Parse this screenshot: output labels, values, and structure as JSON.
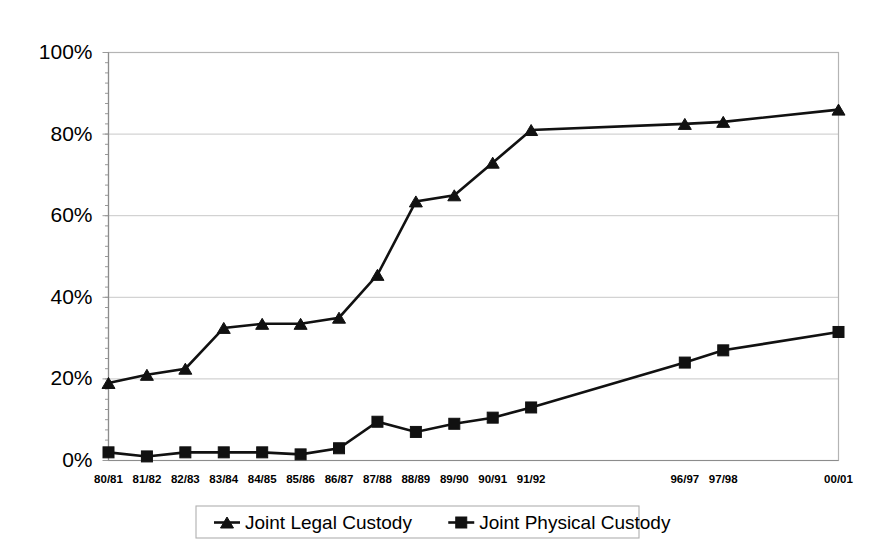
{
  "chart_data": {
    "type": "line",
    "title": "",
    "subtitle": "",
    "xlabel": "",
    "ylabel": "",
    "ylim": [
      0,
      100
    ],
    "ytick_values": [
      0,
      20,
      40,
      60,
      80,
      100
    ],
    "ytick_labels": [
      "0%",
      "20%",
      "40%",
      "60%",
      "80%",
      "100%"
    ],
    "grid": "horizontal",
    "legend_position": "bottom",
    "categories": [
      "80/81",
      "81/82",
      "82/83",
      "83/84",
      "84/85",
      "85/86",
      "86/87",
      "87/88",
      "88/89",
      "89/90",
      "90/91",
      "91/92",
      "",
      "",
      "",
      "96/97",
      "97/98",
      "",
      "",
      "00/01"
    ],
    "visible_xtick_labels": [
      "80/81",
      "81/82",
      "82/83",
      "83/84",
      "84/85",
      "85/86",
      "86/87",
      "87/88",
      "88/89",
      "89/90",
      "90/91",
      "91/92",
      "96/97",
      "97/98",
      "00/01"
    ],
    "series": [
      {
        "name": "Joint Legal Custody",
        "marker": "triangle",
        "color": "#111111",
        "values": [
          19,
          21,
          22.5,
          32.5,
          33.5,
          33.5,
          35,
          45.5,
          63.5,
          65,
          73,
          81,
          null,
          null,
          null,
          82.5,
          83,
          null,
          null,
          86
        ]
      },
      {
        "name": "Joint Physical Custody",
        "marker": "square",
        "color": "#111111",
        "values": [
          2,
          1,
          2,
          2,
          2,
          1.5,
          3,
          9.5,
          7,
          9,
          10.5,
          13,
          null,
          null,
          null,
          24,
          27,
          null,
          null,
          31.5
        ]
      }
    ],
    "legend": [
      {
        "label": "Joint Legal Custody",
        "marker": "triangle"
      },
      {
        "label": "Joint Physical Custody",
        "marker": "square"
      }
    ],
    "colors": {
      "series": "#111111",
      "gridline": "#c8c8c8",
      "plot_border": "#b4b4b4",
      "background": "#ffffff"
    }
  }
}
